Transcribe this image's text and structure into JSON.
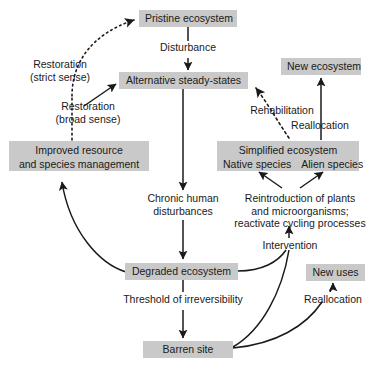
{
  "diagram": {
    "box_fill": "#c9c9c9",
    "text_color": "#1a1a1a",
    "line_color": "#1a1a1a",
    "background": "#ffffff",
    "nodes": [
      {
        "id": "pristine",
        "label": "Pristine ecosystem"
      },
      {
        "id": "alternative",
        "label": "Alternative steady-states"
      },
      {
        "id": "newecosys",
        "label": "New ecosystem"
      },
      {
        "id": "improved",
        "line1": "Improved resource",
        "line2": "and species management"
      },
      {
        "id": "simplified",
        "line1": "Simplified ecosystem",
        "line2a": "Native species",
        "line2b": "Alien species"
      },
      {
        "id": "degraded",
        "label": "Degraded ecosystem"
      },
      {
        "id": "newuses",
        "label": "New uses"
      },
      {
        "id": "barren",
        "label": "Barren site"
      }
    ],
    "edge_labels": [
      {
        "id": "disturbance",
        "label": "Disturbance"
      },
      {
        "id": "restoration-strict",
        "line1": "Restoration",
        "line2": "(strict sense)"
      },
      {
        "id": "restoration-broad",
        "line1": "Restoration",
        "line2": "(broad sense)"
      },
      {
        "id": "rehabilitation",
        "label": "Rehabilitation"
      },
      {
        "id": "reallocation-top",
        "label": "Reallocation"
      },
      {
        "id": "chronic",
        "line1": "Chronic human",
        "line2": "disturbances"
      },
      {
        "id": "reintroduction",
        "line1": "Reintroduction of plants",
        "line2": "and microorganisms;",
        "line3": "reactivate cycling processes"
      },
      {
        "id": "intervention",
        "label": "Intervention"
      },
      {
        "id": "threshold",
        "label": "Threshold of irreversibility"
      },
      {
        "id": "reallocation-bottom",
        "label": "Reallocation"
      }
    ]
  }
}
